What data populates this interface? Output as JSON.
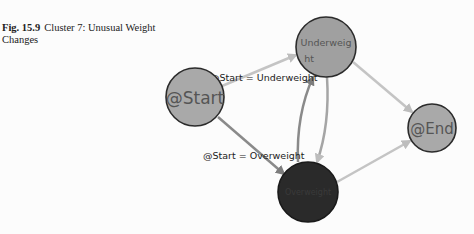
{
  "caption": {
    "figure_number": "Fig. 15.9",
    "title": "Cluster 7: Unusual Weight Changes"
  },
  "diagram": {
    "nodes": [
      {
        "id": "start",
        "label": "@Start",
        "fill": "#a9a9a9"
      },
      {
        "id": "underweight",
        "label_line1": "Underweig",
        "label_line2": "ht",
        "fill": "#a0a0a0"
      },
      {
        "id": "end",
        "label": "@End",
        "fill": "#a9a9a9"
      },
      {
        "id": "overweight",
        "label": "Overweight",
        "fill": "#2a2a2a"
      }
    ],
    "edges": [
      {
        "from": "start",
        "to": "underweight",
        "label": "@Start = Underweight"
      },
      {
        "from": "start",
        "to": "overweight",
        "label": "@Start = Overweight"
      },
      {
        "from": "underweight",
        "to": "end",
        "label": ""
      },
      {
        "from": "overweight",
        "to": "end",
        "label": ""
      },
      {
        "from": "underweight",
        "to": "overweight",
        "label": ""
      },
      {
        "from": "overweight",
        "to": "underweight",
        "label": ""
      }
    ],
    "colors": {
      "edge_light": "#c4c4c4",
      "edge_dark": "#8a8a8a",
      "node_stroke": "#2b2b2b"
    }
  }
}
